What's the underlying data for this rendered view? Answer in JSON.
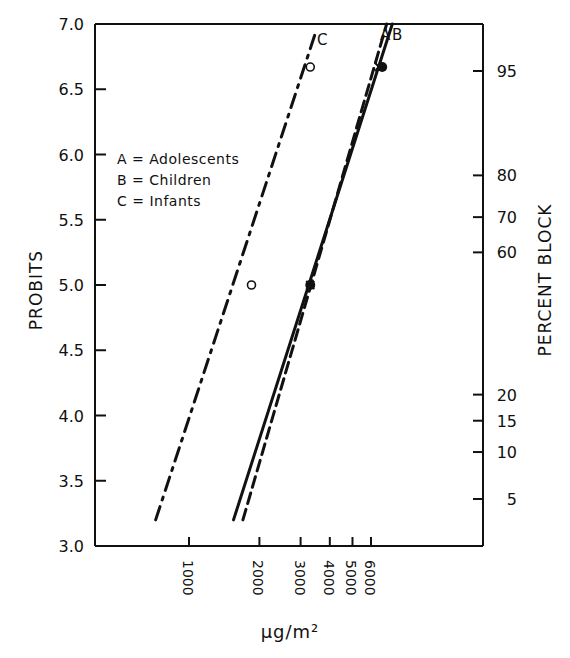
{
  "chart_data": {
    "type": "line",
    "title": "",
    "xlabel": "µg/m²",
    "ylabel": "PROBITS",
    "ylabel_right": "PERCENT BLOCK",
    "x_scale": "log",
    "xlim": [
      550,
      9000
    ],
    "ylim": [
      3.0,
      7.0
    ],
    "x_ticks": [
      1000,
      2000,
      3000,
      4000,
      5000,
      6000
    ],
    "x_tick_labels": [
      "1000",
      "2000",
      "3000",
      "4000",
      "5000",
      "6000"
    ],
    "y_ticks": [
      3.0,
      3.5,
      4.0,
      4.5,
      5.0,
      5.5,
      6.0,
      6.5,
      7.0
    ],
    "y_tick_labels": [
      "3.0",
      "3.5",
      "4.0",
      "4.5",
      "5.0",
      "5.5",
      "6.0",
      "6.5",
      "7.0"
    ],
    "right_ticks": [
      {
        "label": "95",
        "probit": 6.64
      },
      {
        "label": "80",
        "probit": 5.84
      },
      {
        "label": "70",
        "probit": 5.52
      },
      {
        "label": "60",
        "probit": 5.25
      },
      {
        "label": "20",
        "probit": 4.16
      },
      {
        "label": "15",
        "probit": 3.96
      },
      {
        "label": "10",
        "probit": 3.72
      },
      {
        "label": "5",
        "probit": 3.36
      }
    ],
    "grid": false,
    "legend": {
      "position": "upper-left",
      "entries": [
        "A = Adolescents",
        "B = Children",
        "C = Infants"
      ]
    },
    "series": [
      {
        "name": "A",
        "label": "Adolescents",
        "style": "dashed",
        "line": [
          [
            1700,
            3.2
          ],
          [
            7000,
            7.0
          ]
        ],
        "points": [
          [
            3300,
            5.0
          ],
          [
            6500,
            6.67
          ]
        ],
        "marker": "x"
      },
      {
        "name": "B",
        "label": "Children",
        "style": "solid",
        "line": [
          [
            1550,
            3.2
          ],
          [
            7400,
            7.0
          ]
        ],
        "points": [
          [
            3300,
            5.0
          ],
          [
            6700,
            6.67
          ]
        ],
        "marker": "filled-circle"
      },
      {
        "name": "C",
        "label": "Infants",
        "style": "dash-dot",
        "line": [
          [
            720,
            3.2
          ],
          [
            3500,
            6.95
          ]
        ],
        "points": [
          [
            1850,
            5.0
          ],
          [
            3300,
            6.67
          ]
        ],
        "marker": "open-circle"
      }
    ]
  }
}
